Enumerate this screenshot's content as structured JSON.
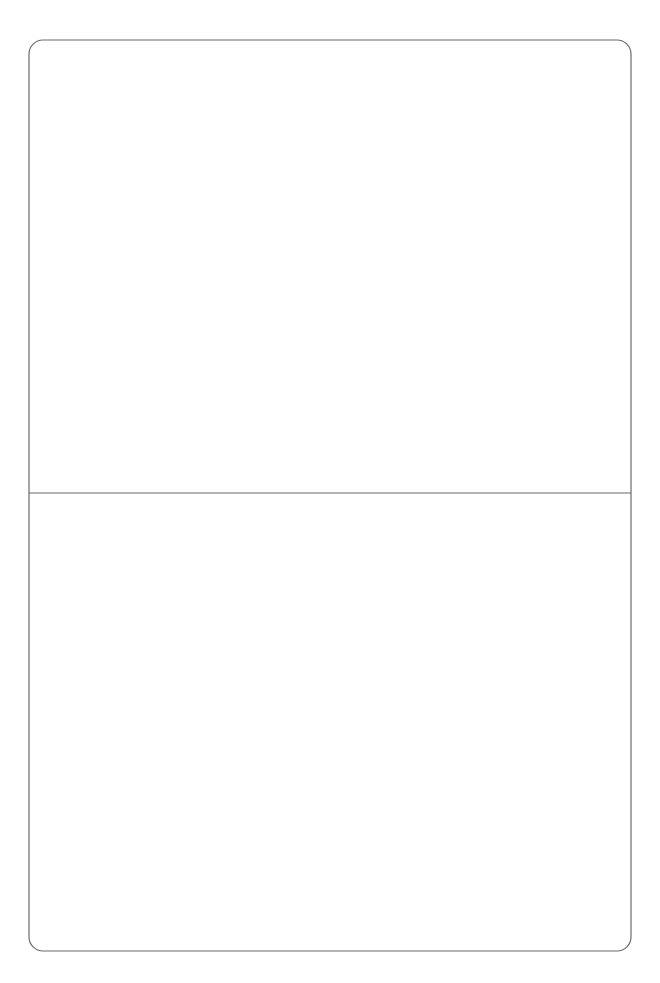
{
  "page": {
    "type": "matchstick-puzzle",
    "panels": [
      {
        "name": "scattered-matches",
        "description": "Loose matchsticks scattered randomly",
        "match_count": 17
      },
      {
        "name": "sos-arrangement",
        "description": "Matchsticks arranged as seven-segment digits",
        "word": "SOS",
        "letters": [
          {
            "char": "S",
            "match_count": 5
          },
          {
            "char": "O",
            "match_count": 6
          },
          {
            "char": "S",
            "match_count": 5
          }
        ]
      }
    ]
  },
  "colors": {
    "background": "#ffffff",
    "frame_stroke": "#6b6b6b",
    "stick_fill": "#ffffff",
    "stick_stroke": "#333333",
    "head_fill": "#151515"
  }
}
